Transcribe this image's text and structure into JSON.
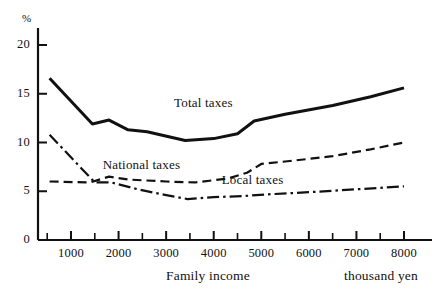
{
  "chart_data": {
    "type": "line",
    "title": "",
    "xlabel": "Family income",
    "xunit": "thousand yen",
    "ylabel": "%",
    "xlim": [
      0,
      8500
    ],
    "ylim": [
      0,
      22
    ],
    "grid": false,
    "legend_position": "inline-annotations",
    "yticks": [
      0,
      5,
      10,
      15,
      20
    ],
    "yticklabels": [
      "0",
      "5",
      "10",
      "15",
      "20"
    ],
    "yminorticks": [],
    "xticks": [
      1000,
      2000,
      3000,
      4000,
      5000,
      6000,
      7000,
      8000
    ],
    "xticklabels": [
      "1000",
      "2000",
      "3000",
      "4000",
      "5000",
      "6000",
      "7000",
      "8000"
    ],
    "xminorticks": [
      500,
      1500,
      2500,
      3500,
      4500,
      5500,
      6500,
      7500
    ],
    "series": [
      {
        "name": "Total taxes",
        "style": "solid",
        "label_x": 4050,
        "label_y": 13.9,
        "x": [
          550,
          1450,
          1800,
          2200,
          2600,
          3400,
          4000,
          4500,
          4850,
          5500,
          6500,
          7300,
          8000
        ],
        "y": [
          16.6,
          11.9,
          12.3,
          11.3,
          11.1,
          10.2,
          10.4,
          10.9,
          12.2,
          12.9,
          13.8,
          14.7,
          15.6
        ]
      },
      {
        "name": "National taxes",
        "style": "dashed",
        "label_x": 2550,
        "label_y": 7.6,
        "x": [
          550,
          1400,
          1800,
          2200,
          3000,
          3600,
          4300,
          4700,
          5000,
          5600,
          6500,
          7300,
          8000
        ],
        "y": [
          6.0,
          5.9,
          6.5,
          6.2,
          6.0,
          5.9,
          6.3,
          6.9,
          7.8,
          8.1,
          8.6,
          9.3,
          10.0
        ]
      },
      {
        "name": "Local taxes",
        "style": "dash-dot",
        "label_x": 5050,
        "label_y": 6.1,
        "x": [
          550,
          1500,
          1850,
          2400,
          3000,
          3450,
          4000,
          4600,
          5200,
          6000,
          7000,
          8000
        ],
        "y": [
          10.8,
          5.9,
          5.9,
          5.2,
          4.6,
          4.2,
          4.4,
          4.5,
          4.7,
          4.9,
          5.2,
          5.5
        ]
      }
    ]
  },
  "axes": {
    "y_unit_label": "%",
    "x_title": "Family income",
    "x_unit_label": "thousand yen"
  }
}
